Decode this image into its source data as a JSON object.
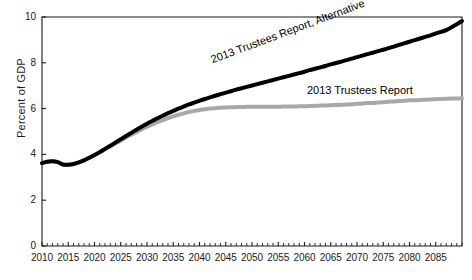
{
  "chart_data": {
    "type": "line",
    "title": "",
    "xlabel": "",
    "ylabel": "Percent of GDP",
    "xlim": [
      2010,
      2090
    ],
    "ylim": [
      0,
      10
    ],
    "ytick_values": [
      0,
      2,
      4,
      6,
      8,
      10
    ],
    "ytick_labels": [
      "0",
      "2",
      "4",
      "6",
      "8",
      "10"
    ],
    "xtick_values": [
      2010,
      2015,
      2020,
      2025,
      2030,
      2035,
      2040,
      2045,
      2050,
      2055,
      2060,
      2065,
      2070,
      2075,
      2080,
      2085
    ],
    "xtick_labels": [
      "2010",
      "2015",
      "2020",
      "2025",
      "2030",
      "2035",
      "2040",
      "2045",
      "2050",
      "2055",
      "2060",
      "2065",
      "2070",
      "2075",
      "2080",
      "2085"
    ],
    "minor_xtick_interval": 1,
    "grid": false,
    "legend_position": "inline-annotations",
    "x": [
      2010,
      2011,
      2012,
      2013,
      2014,
      2015,
      2016,
      2017,
      2018,
      2019,
      2020,
      2021,
      2022,
      2023,
      2024,
      2025,
      2026,
      2027,
      2028,
      2029,
      2030,
      2031,
      2032,
      2033,
      2034,
      2035,
      2036,
      2037,
      2038,
      2039,
      2040,
      2041,
      2042,
      2043,
      2044,
      2045,
      2046,
      2047,
      2048,
      2049,
      2050,
      2051,
      2052,
      2053,
      2054,
      2055,
      2056,
      2057,
      2058,
      2059,
      2060,
      2061,
      2062,
      2063,
      2064,
      2065,
      2066,
      2067,
      2068,
      2069,
      2070,
      2071,
      2072,
      2073,
      2074,
      2075,
      2076,
      2077,
      2078,
      2079,
      2080,
      2081,
      2082,
      2083,
      2084,
      2085,
      2086,
      2087,
      2088,
      2089,
      2090
    ],
    "series": [
      {
        "name": "2013 Trustees Report, Alternative",
        "color": "#000000",
        "linewidth": 4,
        "values": [
          3.62,
          3.68,
          3.7,
          3.66,
          3.56,
          3.55,
          3.58,
          3.65,
          3.74,
          3.85,
          3.97,
          4.1,
          4.24,
          4.38,
          4.52,
          4.66,
          4.8,
          4.94,
          5.08,
          5.21,
          5.34,
          5.46,
          5.58,
          5.69,
          5.8,
          5.9,
          6.0,
          6.09,
          6.18,
          6.26,
          6.34,
          6.42,
          6.49,
          6.56,
          6.63,
          6.7,
          6.76,
          6.83,
          6.89,
          6.95,
          7.01,
          7.07,
          7.13,
          7.19,
          7.25,
          7.31,
          7.37,
          7.43,
          7.49,
          7.55,
          7.61,
          7.68,
          7.74,
          7.8,
          7.86,
          7.93,
          7.99,
          8.05,
          8.12,
          8.18,
          8.25,
          8.31,
          8.38,
          8.44,
          8.51,
          8.57,
          8.64,
          8.71,
          8.78,
          8.85,
          8.92,
          8.99,
          9.06,
          9.13,
          9.2,
          9.28,
          9.35,
          9.43,
          9.55,
          9.68,
          9.82
        ]
      },
      {
        "name": "2013 Trustees Report",
        "color": "#a8a8a8",
        "linewidth": 4,
        "values": [
          3.62,
          3.68,
          3.7,
          3.66,
          3.56,
          3.55,
          3.58,
          3.65,
          3.74,
          3.85,
          3.97,
          4.09,
          4.22,
          4.35,
          4.48,
          4.61,
          4.74,
          4.86,
          4.98,
          5.1,
          5.21,
          5.31,
          5.41,
          5.5,
          5.58,
          5.66,
          5.73,
          5.79,
          5.85,
          5.9,
          5.94,
          5.97,
          6.0,
          6.02,
          6.04,
          6.05,
          6.06,
          6.07,
          6.07,
          6.08,
          6.08,
          6.08,
          6.08,
          6.08,
          6.08,
          6.08,
          6.09,
          6.09,
          6.09,
          6.1,
          6.1,
          6.11,
          6.12,
          6.13,
          6.14,
          6.15,
          6.16,
          6.17,
          6.18,
          6.19,
          6.21,
          6.22,
          6.24,
          6.25,
          6.27,
          6.28,
          6.3,
          6.31,
          6.33,
          6.34,
          6.36,
          6.37,
          6.38,
          6.39,
          6.4,
          6.41,
          6.42,
          6.43,
          6.44,
          6.44,
          6.45
        ]
      }
    ],
    "annotations": [
      {
        "text": "2013 Trustees Report, Alternative",
        "rotation": -20.5
      },
      {
        "text": "2013 Trustees Report",
        "rotation": 0
      }
    ]
  }
}
